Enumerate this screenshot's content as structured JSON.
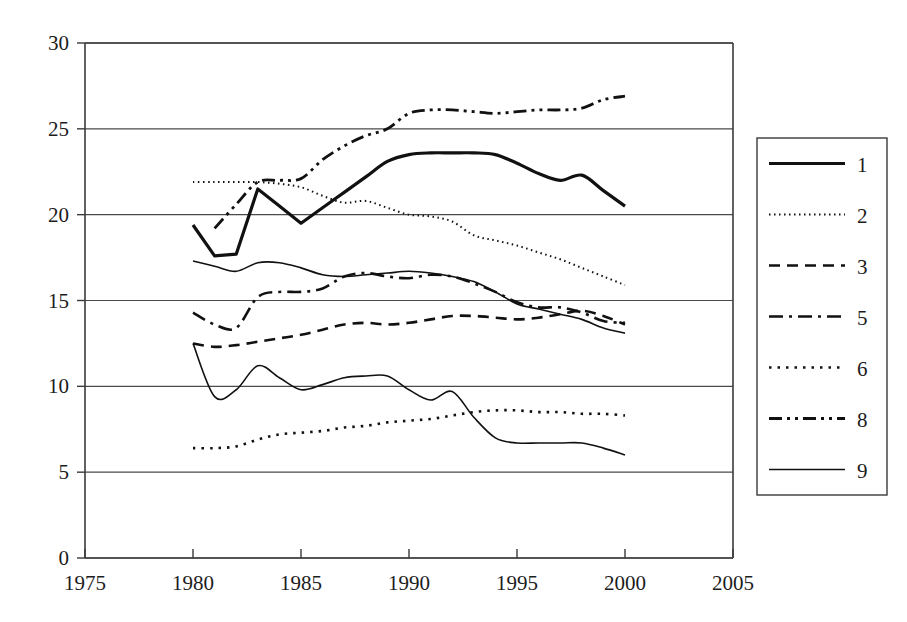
{
  "chart_data": {
    "type": "line",
    "title": "",
    "xlabel": "",
    "ylabel": "",
    "xlim": [
      1975,
      2005
    ],
    "ylim": [
      0,
      30
    ],
    "xticks": [
      1975,
      1980,
      1985,
      1990,
      1995,
      2000,
      2005
    ],
    "yticks": [
      0,
      5,
      10,
      15,
      20,
      25,
      30
    ],
    "grid": "horizontal",
    "legend_position": "right-outside",
    "legend_entries": [
      "1",
      "2",
      "3",
      "5",
      "6",
      "8",
      "9"
    ],
    "series": [
      {
        "name": "1",
        "label": "1",
        "style": "solid-thick",
        "stroke_width": 3.2,
        "dash": "none",
        "x": [
          1980,
          1981,
          1982,
          1983,
          1984,
          1985,
          1986,
          1987,
          1988,
          1989,
          1990,
          1991,
          1992,
          1993,
          1994,
          1995,
          1996,
          1997,
          1998,
          1999,
          2000
        ],
        "values": [
          19.4,
          17.6,
          17.7,
          21.5,
          20.5,
          19.5,
          20.4,
          21.3,
          22.2,
          23.1,
          23.5,
          23.6,
          23.6,
          23.6,
          23.5,
          23.0,
          22.4,
          22.0,
          22.3,
          21.4,
          20.5
        ]
      },
      {
        "name": "2",
        "label": "2",
        "style": "dotted-fine",
        "stroke_width": 2.0,
        "dash": "1.5 3.5",
        "x": [
          1980,
          1981,
          1982,
          1983,
          1984,
          1985,
          1986,
          1987,
          1988,
          1989,
          1990,
          1991,
          1992,
          1993,
          1994,
          1995,
          1996,
          1997,
          1998,
          1999,
          2000
        ],
        "values": [
          21.9,
          21.9,
          21.9,
          21.9,
          21.8,
          21.6,
          21.1,
          20.7,
          20.8,
          20.4,
          20.0,
          19.9,
          19.6,
          18.8,
          18.5,
          18.2,
          17.8,
          17.4,
          16.9,
          16.4,
          15.9
        ]
      },
      {
        "name": "3",
        "label": "3",
        "style": "dashed",
        "stroke_width": 2.6,
        "dash": "11 7",
        "x": [
          1980,
          1981,
          1982,
          1983,
          1984,
          1985,
          1986,
          1987,
          1988,
          1989,
          1990,
          1991,
          1992,
          1993,
          1994,
          1995,
          1996,
          1997,
          1998,
          1999,
          2000
        ],
        "values": [
          12.5,
          12.3,
          12.4,
          12.6,
          12.8,
          13.0,
          13.3,
          13.6,
          13.7,
          13.6,
          13.7,
          13.9,
          14.1,
          14.1,
          14.0,
          13.9,
          14.0,
          14.2,
          14.4,
          14.1,
          13.6
        ]
      },
      {
        "name": "5",
        "label": "5",
        "style": "dash-dot",
        "stroke_width": 2.6,
        "dash": "14 6 3 6",
        "x": [
          1980,
          1981,
          1982,
          1983,
          1984,
          1985,
          1986,
          1987,
          1988,
          1989,
          1990,
          1991,
          1992,
          1993,
          1994,
          1995,
          1996,
          1997,
          1998,
          1999,
          2000
        ],
        "values": [
          14.3,
          13.6,
          13.4,
          15.2,
          15.5,
          15.5,
          15.7,
          16.4,
          16.6,
          16.4,
          16.3,
          16.5,
          16.4,
          16.0,
          15.5,
          14.9,
          14.6,
          14.6,
          14.3,
          13.8,
          13.7
        ]
      },
      {
        "name": "6",
        "label": "6",
        "style": "dotted-coarse",
        "stroke_width": 2.6,
        "dash": "2.5 6",
        "x": [
          1980,
          1981,
          1982,
          1983,
          1984,
          1985,
          1986,
          1987,
          1988,
          1989,
          1990,
          1991,
          1992,
          1993,
          1994,
          1995,
          1996,
          1997,
          1998,
          1999,
          2000
        ],
        "values": [
          6.4,
          6.4,
          6.5,
          6.9,
          7.2,
          7.3,
          7.4,
          7.6,
          7.7,
          7.9,
          8.0,
          8.1,
          8.3,
          8.5,
          8.6,
          8.6,
          8.5,
          8.5,
          8.4,
          8.4,
          8.3
        ]
      },
      {
        "name": "8",
        "label": "8",
        "style": "dash-dot-dot",
        "stroke_width": 2.8,
        "dash": "13 5 3 5 3 5",
        "x": [
          1981,
          1982,
          1983,
          1984,
          1985,
          1986,
          1987,
          1988,
          1989,
          1990,
          1991,
          1992,
          1993,
          1994,
          1995,
          1996,
          1997,
          1998,
          1999,
          2000
        ],
        "values": [
          19.2,
          20.6,
          21.9,
          22.0,
          22.1,
          23.2,
          24.0,
          24.6,
          25.0,
          25.9,
          26.1,
          26.1,
          26.0,
          25.9,
          26.0,
          26.1,
          26.1,
          26.2,
          26.7,
          26.9
        ]
      },
      {
        "name": "9",
        "label": "9",
        "style": "solid-thin",
        "stroke_width": 1.6,
        "dash": "none",
        "x": [
          1980,
          1981,
          1982,
          1983,
          1984,
          1985,
          1986,
          1987,
          1988,
          1989,
          1990,
          1991,
          1992,
          1993,
          1994,
          1995,
          1996,
          1997,
          1998,
          1999,
          2000
        ],
        "values": [
          17.3,
          17.0,
          16.7,
          17.2,
          17.2,
          16.9,
          16.5,
          16.4,
          16.5,
          16.6,
          16.7,
          16.6,
          16.4,
          16.1,
          15.5,
          14.8,
          14.5,
          14.2,
          13.9,
          13.4,
          13.1
        ]
      },
      {
        "name": "9b",
        "label": "9",
        "style": "solid-thin",
        "stroke_width": 1.6,
        "dash": "none",
        "x": [
          1980,
          1981,
          1982,
          1983,
          1984,
          1985,
          1986,
          1987,
          1988,
          1989,
          1990,
          1991,
          1992,
          1993,
          1994,
          1995,
          1996,
          1997,
          1998,
          1999,
          2000
        ],
        "values": [
          12.5,
          9.4,
          9.8,
          11.2,
          10.5,
          9.8,
          10.1,
          10.5,
          10.6,
          10.6,
          9.8,
          9.2,
          9.7,
          8.2,
          7.0,
          6.7,
          6.7,
          6.7,
          6.7,
          6.4,
          6.0
        ]
      }
    ]
  },
  "axes": {
    "x_tick_labels": [
      "1975",
      "1980",
      "1985",
      "1990",
      "1995",
      "2000",
      "2005"
    ],
    "y_tick_labels": [
      "0",
      "5",
      "10",
      "15",
      "20",
      "25",
      "30"
    ]
  },
  "legend": {
    "items": [
      {
        "label": "1",
        "style": "solid-thick"
      },
      {
        "label": "2",
        "style": "dotted-fine"
      },
      {
        "label": "3",
        "style": "dashed"
      },
      {
        "label": "5",
        "style": "dash-dot"
      },
      {
        "label": "6",
        "style": "dotted-coarse"
      },
      {
        "label": "8",
        "style": "dash-dot-dot"
      },
      {
        "label": "9",
        "style": "solid-thin"
      }
    ]
  }
}
